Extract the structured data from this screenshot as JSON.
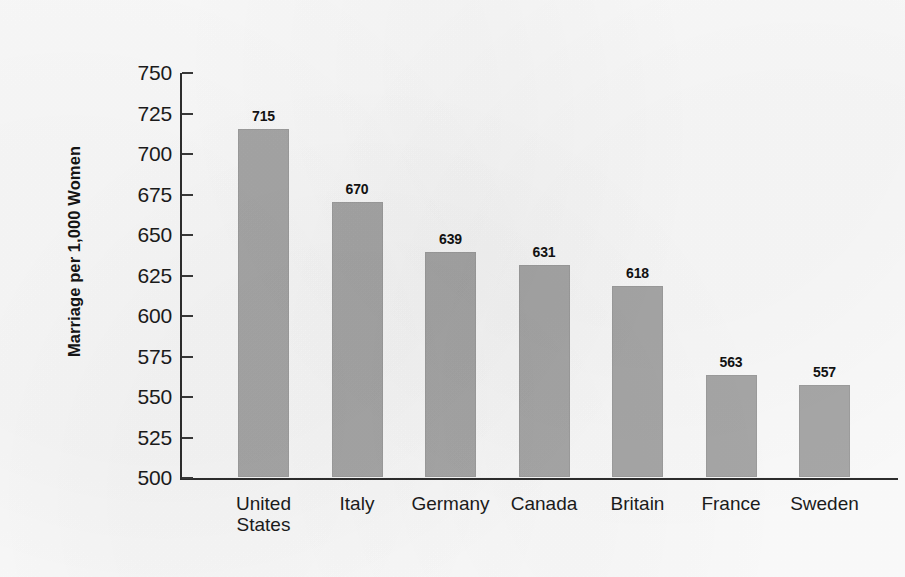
{
  "chart_data": {
    "type": "bar",
    "title": "",
    "xlabel": "",
    "ylabel": "Marriage per 1,000 Women",
    "categories": [
      "United\nStates",
      "Italy",
      "Germany",
      "Canada",
      "Britain",
      "France",
      "Sweden"
    ],
    "values": [
      715,
      670,
      639,
      631,
      618,
      563,
      557
    ],
    "value_labels": [
      "715",
      "670",
      "639",
      "631",
      "618",
      "563",
      "557"
    ],
    "ylim": [
      500,
      750
    ],
    "ytick_labels": [
      "750",
      "725",
      "700",
      "675",
      "650",
      "625",
      "600",
      "575",
      "550",
      "525",
      "500"
    ],
    "ytick_values": [
      750,
      725,
      700,
      675,
      650,
      625,
      600,
      575,
      550,
      525,
      500
    ],
    "grid": false,
    "legend": null,
    "bar_color": "#a9a9a9",
    "axis_color": "#2e2e2e",
    "text_color": "#1b1b1b",
    "background_color": "#fdfdfd"
  }
}
